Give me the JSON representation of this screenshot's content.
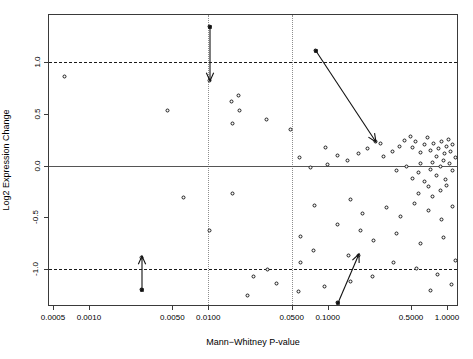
{
  "chart_data": {
    "type": "scatter",
    "title": "",
    "xlabel": "Mann−Whitney P-value",
    "ylabel": "Log2 Expression Change",
    "xscale": "log",
    "xlim": [
      0.00042,
      1.25
    ],
    "ylim": [
      -1.35,
      1.45
    ],
    "xticks": [
      0.0005,
      0.001,
      0.005,
      0.01,
      0.05,
      0.1,
      0.5,
      1.0
    ],
    "xticklabels": [
      "0.0005",
      "0.0010",
      "0.0050",
      "0.0100",
      "0.0500",
      "0.1000",
      "0.5000",
      "1.0000"
    ],
    "yticks": [
      1.0,
      0.5,
      0.0,
      -0.5,
      -1.0
    ],
    "yticklabels": [
      "1.0",
      "0.5",
      "0.0",
      "-0.5",
      "-1.0"
    ],
    "grid": "vertical-dotted-at-0.01-and-0.05",
    "reference_lines": [
      {
        "y": 1.0,
        "style": "dashed",
        "color": "#1a1a1a"
      },
      {
        "y": 0.0,
        "style": "solid",
        "color": "#555555"
      },
      {
        "y": -1.0,
        "style": "dashed",
        "color": "#1a1a1a"
      }
    ],
    "marker": {
      "shape": "open-circle",
      "color": "#1b1b1b",
      "fill": "#ffffff",
      "size": 4
    },
    "points_px": [
      [
        64,
        76
      ],
      [
        167,
        110
      ],
      [
        209,
        26
      ],
      [
        209,
        80
      ],
      [
        231,
        101
      ],
      [
        238,
        95
      ],
      [
        239,
        110
      ],
      [
        232,
        123
      ],
      [
        266,
        119
      ],
      [
        290,
        129
      ],
      [
        315,
        50
      ],
      [
        375,
        141
      ],
      [
        299,
        157
      ],
      [
        325,
        147
      ],
      [
        327,
        164
      ],
      [
        337,
        155
      ],
      [
        347,
        160
      ],
      [
        358,
        153
      ],
      [
        310,
        167
      ],
      [
        367,
        148
      ],
      [
        380,
        143
      ],
      [
        383,
        156
      ],
      [
        392,
        151
      ],
      [
        399,
        146
      ],
      [
        404,
        140
      ],
      [
        410,
        136
      ],
      [
        412,
        147
      ],
      [
        415,
        141
      ],
      [
        420,
        152
      ],
      [
        424,
        144
      ],
      [
        427,
        137
      ],
      [
        430,
        150
      ],
      [
        433,
        143
      ],
      [
        436,
        156
      ],
      [
        438,
        148
      ],
      [
        441,
        141
      ],
      [
        444,
        153
      ],
      [
        446,
        146
      ],
      [
        448,
        139
      ],
      [
        450,
        151
      ],
      [
        452,
        144
      ],
      [
        455,
        157
      ],
      [
        443,
        160
      ],
      [
        432,
        162
      ],
      [
        420,
        163
      ],
      [
        406,
        166
      ],
      [
        396,
        170
      ],
      [
        418,
        172
      ],
      [
        430,
        169
      ],
      [
        440,
        166
      ],
      [
        449,
        163
      ],
      [
        452,
        170
      ],
      [
        412,
        178
      ],
      [
        424,
        181
      ],
      [
        436,
        175
      ],
      [
        445,
        179
      ],
      [
        428,
        186
      ],
      [
        440,
        190
      ],
      [
        418,
        193
      ],
      [
        432,
        196
      ],
      [
        446,
        185
      ],
      [
        314,
        205
      ],
      [
        350,
        199
      ],
      [
        362,
        213
      ],
      [
        386,
        207
      ],
      [
        400,
        216
      ],
      [
        414,
        203
      ],
      [
        428,
        210
      ],
      [
        441,
        219
      ],
      [
        452,
        206
      ],
      [
        337,
        224
      ],
      [
        360,
        230
      ],
      [
        300,
        236
      ],
      [
        373,
        240
      ],
      [
        396,
        233
      ],
      [
        420,
        243
      ],
      [
        443,
        237
      ],
      [
        313,
        250
      ],
      [
        348,
        255
      ],
      [
        141,
        289
      ],
      [
        141,
        257
      ],
      [
        337,
        302
      ],
      [
        358,
        255
      ],
      [
        247,
        295
      ],
      [
        267,
        269
      ],
      [
        300,
        262
      ],
      [
        209,
        230
      ],
      [
        232,
        193
      ],
      [
        183,
        197
      ],
      [
        393,
        262
      ],
      [
        416,
        268
      ],
      [
        437,
        274
      ],
      [
        455,
        260
      ],
      [
        372,
        276
      ],
      [
        350,
        281
      ],
      [
        324,
        286
      ],
      [
        298,
        291
      ],
      [
        276,
        283
      ],
      [
        253,
        276
      ],
      [
        451,
        284
      ],
      [
        430,
        290
      ]
    ],
    "annotations": [
      {
        "name": "arrow-down-upper-mid",
        "from_px": [
          209,
          26
        ],
        "to_px": [
          209,
          80
        ],
        "direction": "down"
      },
      {
        "name": "arrow-diagonal-upper-right",
        "from_px": [
          315,
          50
        ],
        "to_px": [
          375,
          141
        ],
        "direction": "down-right"
      },
      {
        "name": "arrow-up-lower-left",
        "from_px": [
          141,
          289
        ],
        "to_px": [
          141,
          255
        ],
        "direction": "up"
      },
      {
        "name": "arrow-diagonal-lower-mid",
        "from_px": [
          337,
          302
        ],
        "to_px": [
          358,
          253
        ],
        "direction": "up-right"
      }
    ]
  },
  "axes": {
    "x_title": "Mann−Whitney P-value",
    "y_title": "Log2 Expression Change"
  }
}
